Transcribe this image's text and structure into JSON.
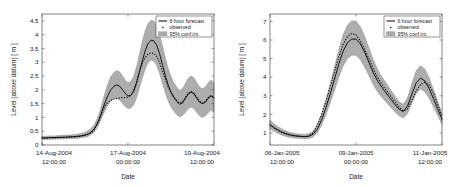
{
  "figure": {
    "background": "#ffffff",
    "panel_count": 2
  },
  "style": {
    "forecast_color": "#000000",
    "observed_color": "#000000",
    "band_color": "#a9a9a9",
    "band_edge_color": "#8c8c8c",
    "axis_color": "#4d4d4d",
    "text_color": "#1a1a1a"
  },
  "legend": {
    "position": "top-right",
    "items": [
      {
        "label": "6 hour forecast",
        "marker": "line"
      },
      {
        "label": "observed",
        "marker": "dot"
      },
      {
        "label": "95% conf.int.",
        "marker": "band"
      }
    ]
  },
  "chart_data": [
    {
      "type": "line",
      "id": "august-2004-event",
      "title": "",
      "xlabel": "Date",
      "ylabel": "Level (above datum) [ m ]",
      "grid": false,
      "legend_position": "top-right",
      "ylim": [
        0,
        4.75
      ],
      "yticks": [
        0,
        0.5,
        1,
        1.5,
        2,
        2.5,
        3,
        3.5,
        4,
        4.5
      ],
      "ytick_labels": [
        "0",
        "0.5",
        "1",
        "1.5",
        "2",
        "2.5",
        "3",
        "3.5",
        "4",
        "4.5"
      ],
      "xlim": [
        0,
        120
      ],
      "xticks": [
        0,
        60,
        120
      ],
      "xtick_labels": [
        [
          "14-Aug-2004",
          "12:00:00"
        ],
        [
          "17-Aug-2004",
          "00:00:00"
        ],
        [
          "19-Aug-2004",
          "12:00:00"
        ]
      ],
      "x_unit": "hours from 14-Aug-2004 12:00:00",
      "x": [
        0,
        3,
        6,
        9,
        12,
        15,
        18,
        21,
        24,
        27,
        30,
        33,
        36,
        38,
        40,
        42,
        44,
        46,
        48,
        50,
        52,
        54,
        56,
        58,
        60,
        62,
        64,
        66,
        68,
        70,
        72,
        74,
        76,
        78,
        80,
        82,
        84,
        86,
        88,
        90,
        92,
        94,
        96,
        98,
        100,
        102,
        104,
        106,
        108,
        110,
        112,
        114,
        116,
        118,
        120
      ],
      "series": [
        {
          "name": "6 hour forecast",
          "style": "solid-line",
          "values": [
            0.26,
            0.26,
            0.27,
            0.27,
            0.28,
            0.28,
            0.29,
            0.3,
            0.31,
            0.33,
            0.36,
            0.42,
            0.55,
            0.72,
            0.95,
            1.25,
            1.55,
            1.8,
            2.0,
            2.12,
            2.18,
            2.14,
            2.02,
            1.88,
            1.78,
            1.8,
            1.95,
            2.25,
            2.65,
            3.05,
            3.42,
            3.68,
            3.8,
            3.78,
            3.62,
            3.32,
            2.92,
            2.52,
            2.18,
            1.92,
            1.72,
            1.58,
            1.48,
            1.52,
            1.68,
            1.85,
            1.92,
            1.86,
            1.7,
            1.55,
            1.5,
            1.55,
            1.7,
            1.78,
            1.7
          ]
        },
        {
          "name": "observed",
          "style": "dotted",
          "values": [
            0.25,
            0.25,
            0.26,
            0.26,
            0.27,
            0.28,
            0.28,
            0.29,
            0.3,
            0.32,
            0.35,
            0.4,
            0.52,
            0.7,
            0.92,
            1.2,
            1.42,
            1.55,
            1.62,
            1.66,
            1.68,
            1.7,
            1.72,
            1.72,
            1.74,
            1.8,
            1.98,
            2.3,
            2.68,
            2.98,
            3.18,
            3.3,
            3.34,
            3.32,
            3.22,
            3.0,
            2.7,
            2.38,
            2.1,
            1.9,
            1.74,
            1.62,
            1.52,
            1.56,
            1.72,
            1.88,
            1.94,
            1.88,
            1.72,
            1.58,
            1.52,
            1.58,
            1.72,
            1.8,
            1.72
          ]
        }
      ],
      "confidence_band": {
        "name": "95% conf.int.",
        "lower": [
          0.2,
          0.2,
          0.21,
          0.21,
          0.22,
          0.22,
          0.23,
          0.24,
          0.24,
          0.26,
          0.28,
          0.33,
          0.44,
          0.58,
          0.78,
          1.02,
          1.25,
          1.45,
          1.6,
          1.68,
          1.7,
          1.64,
          1.52,
          1.4,
          1.32,
          1.34,
          1.46,
          1.72,
          2.08,
          2.42,
          2.76,
          2.98,
          3.08,
          3.04,
          2.88,
          2.6,
          2.24,
          1.9,
          1.6,
          1.38,
          1.22,
          1.1,
          1.02,
          1.06,
          1.18,
          1.32,
          1.38,
          1.32,
          1.18,
          1.05,
          1.0,
          1.05,
          1.18,
          1.26,
          1.18
        ],
        "upper": [
          0.32,
          0.32,
          0.33,
          0.33,
          0.34,
          0.35,
          0.36,
          0.37,
          0.39,
          0.42,
          0.46,
          0.54,
          0.7,
          0.9,
          1.16,
          1.52,
          1.9,
          2.22,
          2.48,
          2.62,
          2.7,
          2.66,
          2.52,
          2.36,
          2.26,
          2.3,
          2.48,
          2.84,
          3.3,
          3.76,
          4.14,
          4.4,
          4.52,
          4.5,
          4.34,
          4.02,
          3.6,
          3.16,
          2.78,
          2.48,
          2.26,
          2.1,
          1.98,
          2.04,
          2.22,
          2.42,
          2.5,
          2.44,
          2.26,
          2.1,
          2.04,
          2.1,
          2.26,
          2.36,
          2.26
        ]
      }
    },
    {
      "type": "line",
      "id": "january-2005-event",
      "title": "",
      "xlabel": "Date",
      "ylabel": "Level (above datum) [ m ]",
      "grid": false,
      "legend_position": "top-right",
      "ylim": [
        0.35,
        7.4
      ],
      "yticks": [
        1,
        2,
        3,
        4,
        5,
        6,
        7
      ],
      "ytick_labels": [
        "1",
        "2",
        "3",
        "4",
        "5",
        "6",
        "7"
      ],
      "xlim": [
        0,
        120
      ],
      "xticks": [
        0,
        60,
        120
      ],
      "xtick_labels": [
        [
          "06-Jan-2005",
          "12:00:00"
        ],
        [
          "09-Jan-2005",
          "00:00:00"
        ],
        [
          "11-Jan-2005",
          "12:00:00"
        ]
      ],
      "x_unit": "hours from 06-Jan-2005 12:00:00",
      "x": [
        0,
        3,
        6,
        9,
        12,
        15,
        18,
        21,
        24,
        27,
        30,
        33,
        36,
        39,
        42,
        45,
        48,
        51,
        54,
        57,
        60,
        63,
        66,
        69,
        72,
        75,
        78,
        81,
        84,
        87,
        90,
        93,
        96,
        99,
        102,
        105,
        108,
        111,
        114,
        117,
        120
      ],
      "series": [
        {
          "name": "6 hour forecast",
          "style": "solid-line",
          "values": [
            1.45,
            1.28,
            1.14,
            1.02,
            0.94,
            0.88,
            0.84,
            0.82,
            0.8,
            0.82,
            0.92,
            1.2,
            1.7,
            2.35,
            3.1,
            3.9,
            4.7,
            5.4,
            5.85,
            6.05,
            6.05,
            5.8,
            5.35,
            4.8,
            4.25,
            3.8,
            3.45,
            3.15,
            2.85,
            2.55,
            2.28,
            2.15,
            2.45,
            3.1,
            3.7,
            3.95,
            3.8,
            3.4,
            2.85,
            2.3,
            1.72
          ]
        },
        {
          "name": "observed",
          "style": "dotted",
          "values": [
            1.42,
            1.26,
            1.12,
            1.0,
            0.92,
            0.86,
            0.83,
            0.81,
            0.8,
            0.84,
            1.0,
            1.42,
            2.0,
            2.7,
            3.5,
            4.3,
            5.1,
            5.75,
            6.18,
            6.35,
            6.28,
            5.95,
            5.5,
            5.0,
            4.45,
            4.0,
            3.62,
            3.3,
            3.0,
            2.7,
            2.4,
            2.18,
            2.3,
            2.75,
            3.25,
            3.62,
            3.72,
            3.58,
            3.15,
            2.55,
            1.9
          ]
        }
      ],
      "confidence_band": {
        "name": "95% conf.int.",
        "lower": [
          1.22,
          1.08,
          0.96,
          0.86,
          0.8,
          0.75,
          0.72,
          0.7,
          0.69,
          0.7,
          0.78,
          1.0,
          1.42,
          1.98,
          2.62,
          3.3,
          4.0,
          4.6,
          5.0,
          5.18,
          5.18,
          4.95,
          4.55,
          4.08,
          3.6,
          3.22,
          2.92,
          2.66,
          2.4,
          2.15,
          1.92,
          1.8,
          2.05,
          2.62,
          3.14,
          3.36,
          3.22,
          2.88,
          2.4,
          1.94,
          1.46
        ],
        "upper": [
          1.68,
          1.48,
          1.32,
          1.18,
          1.08,
          1.01,
          0.96,
          0.94,
          0.92,
          0.96,
          1.08,
          1.42,
          2.0,
          2.76,
          3.62,
          4.55,
          5.48,
          6.28,
          6.8,
          7.02,
          7.02,
          6.72,
          6.2,
          5.58,
          4.94,
          4.42,
          4.02,
          3.68,
          3.34,
          3.0,
          2.68,
          2.54,
          2.9,
          3.66,
          4.34,
          4.62,
          4.44,
          3.98,
          3.34,
          2.7,
          2.02
        ]
      }
    }
  ]
}
